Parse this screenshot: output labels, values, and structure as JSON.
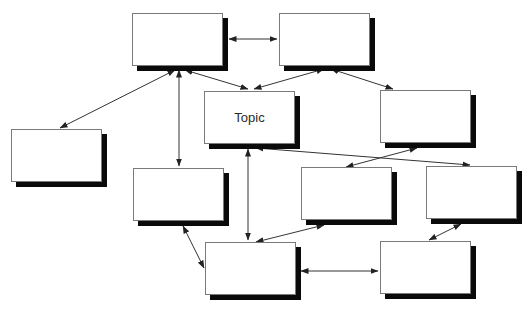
{
  "diagram": {
    "title": "",
    "style": {
      "box_fill": "#ffffff",
      "box_border": "#7a7a7a",
      "shadow_color": "#0a0a0a",
      "edge_color": "#333333",
      "shadow_offset": 5
    },
    "nodes": [
      {
        "id": "n1",
        "label": "",
        "x": 132,
        "y": 13,
        "w": 91,
        "h": 53
      },
      {
        "id": "n2",
        "label": "",
        "x": 279,
        "y": 13,
        "w": 91,
        "h": 53
      },
      {
        "id": "topic",
        "label": "Topic",
        "x": 204,
        "y": 91,
        "w": 91,
        "h": 53
      },
      {
        "id": "n4",
        "label": "",
        "x": 380,
        "y": 90,
        "w": 91,
        "h": 53
      },
      {
        "id": "n5",
        "label": "",
        "x": 11,
        "y": 129,
        "w": 91,
        "h": 53
      },
      {
        "id": "n6",
        "label": "",
        "x": 133,
        "y": 168,
        "w": 91,
        "h": 53
      },
      {
        "id": "n7",
        "label": "",
        "x": 301,
        "y": 167,
        "w": 91,
        "h": 53
      },
      {
        "id": "n8",
        "label": "",
        "x": 426,
        "y": 166,
        "w": 91,
        "h": 53
      },
      {
        "id": "n9",
        "label": "",
        "x": 205,
        "y": 242,
        "w": 91,
        "h": 53
      },
      {
        "id": "n10",
        "label": "",
        "x": 380,
        "y": 241,
        "w": 91,
        "h": 53
      }
    ],
    "edges": [
      {
        "from": "n1",
        "to": "n2",
        "x1": 229,
        "y1": 39,
        "x2": 277,
        "y2": 39,
        "start_arrow": true,
        "end_arrow": true
      },
      {
        "from": "n1",
        "to": "n5",
        "x1": 175,
        "y1": 70,
        "x2": 60,
        "y2": 128,
        "start_arrow": true,
        "end_arrow": true
      },
      {
        "from": "n1",
        "to": "n6",
        "x1": 179,
        "y1": 70,
        "x2": 179,
        "y2": 166,
        "start_arrow": true,
        "end_arrow": true
      },
      {
        "from": "n1",
        "to": "topic",
        "x1": 185,
        "y1": 70,
        "x2": 248,
        "y2": 89,
        "start_arrow": true,
        "end_arrow": true
      },
      {
        "from": "n2",
        "to": "topic",
        "x1": 324,
        "y1": 69,
        "x2": 254,
        "y2": 89,
        "start_arrow": true,
        "end_arrow": true
      },
      {
        "from": "n2",
        "to": "n4",
        "x1": 331,
        "y1": 69,
        "x2": 393,
        "y2": 89,
        "start_arrow": true,
        "end_arrow": true
      },
      {
        "from": "topic",
        "to": "n9",
        "x1": 248,
        "y1": 149,
        "x2": 248,
        "y2": 240,
        "start_arrow": true,
        "end_arrow": true
      },
      {
        "from": "topic",
        "to": "n8",
        "x1": 256,
        "y1": 148,
        "x2": 470,
        "y2": 165,
        "start_arrow": true,
        "end_arrow": true
      },
      {
        "from": "n4",
        "to": "n7",
        "x1": 417,
        "y1": 148,
        "x2": 346,
        "y2": 167,
        "start_arrow": true,
        "end_arrow": true
      },
      {
        "from": "n6",
        "to": "n9",
        "x1": 183,
        "y1": 226,
        "x2": 204,
        "y2": 268,
        "start_arrow": true,
        "end_arrow": true
      },
      {
        "from": "n7",
        "to": "n9",
        "x1": 324,
        "y1": 225,
        "x2": 256,
        "y2": 242,
        "start_arrow": true,
        "end_arrow": true
      },
      {
        "from": "n8",
        "to": "n10",
        "x1": 461,
        "y1": 224,
        "x2": 429,
        "y2": 240,
        "start_arrow": true,
        "end_arrow": true
      },
      {
        "from": "n9",
        "to": "n10",
        "x1": 301,
        "y1": 271,
        "x2": 378,
        "y2": 271,
        "start_arrow": true,
        "end_arrow": true
      }
    ]
  }
}
